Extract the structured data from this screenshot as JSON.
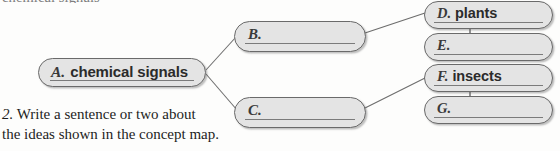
{
  "page": {
    "clipped_heading_fragment": "chemical signals",
    "background_color": "#fdfdfc"
  },
  "colors": {
    "node_fill": "#e4e4e4",
    "node_border": "#6a6a6a",
    "connector": "#6d6d6d",
    "answer_text": "#2b2b2b",
    "letter_text": "#3a3a3a",
    "body_text": "#1d1d1d"
  },
  "concept_map": {
    "nodes": [
      {
        "id": "a",
        "letter": "A.",
        "answer": "chemical signals",
        "filled": true,
        "column": "left"
      },
      {
        "id": "b",
        "letter": "B.",
        "answer": "",
        "filled": false,
        "column": "middle"
      },
      {
        "id": "c",
        "letter": "C.",
        "answer": "",
        "filled": false,
        "column": "middle"
      },
      {
        "id": "d",
        "letter": "D.",
        "answer": "plants",
        "filled": true,
        "column": "right"
      },
      {
        "id": "e",
        "letter": "E.",
        "answer": "",
        "filled": false,
        "column": "right"
      },
      {
        "id": "f",
        "letter": "F.",
        "answer": "insects",
        "filled": true,
        "column": "right"
      },
      {
        "id": "g",
        "letter": "G.",
        "answer": "",
        "filled": false,
        "column": "right"
      }
    ],
    "connections": [
      {
        "from": "a",
        "to": "b",
        "style": "diagonal"
      },
      {
        "from": "a",
        "to": "c",
        "style": "diagonal"
      },
      {
        "from": "b",
        "to": "d",
        "style": "diagonal"
      },
      {
        "from": "c",
        "to": "f",
        "style": "diagonal"
      },
      {
        "from": "d",
        "to": "e",
        "style": "vertical-stub"
      },
      {
        "from": "f",
        "to": "g",
        "style": "vertical-stub"
      }
    ]
  },
  "question": {
    "number": "2.",
    "line1": "Write a sentence or two about",
    "line2": "the ideas shown in the concept map."
  }
}
